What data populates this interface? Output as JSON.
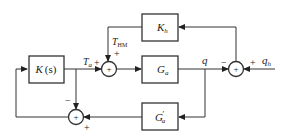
{
  "diagram": {
    "type": "block-diagram",
    "blocks": [
      {
        "id": "K",
        "main": "K",
        "arg": "(s)",
        "sub": ""
      },
      {
        "id": "Ga",
        "main": "G",
        "sub": "a"
      },
      {
        "id": "Kh",
        "main": "K",
        "sub": "h"
      },
      {
        "id": "Gpa",
        "main": "G",
        "prime": "′",
        "sub": "a"
      }
    ],
    "signals": {
      "Ta": {
        "main": "T",
        "sub": "a"
      },
      "THM": {
        "main": "T",
        "sub": "HM"
      },
      "q": {
        "main": "q"
      },
      "qh": {
        "main": "q",
        "sub": "h"
      }
    },
    "summing_junctions": [
      {
        "id": "sum_top",
        "symbol": "+",
        "signs": {
          "left": "+",
          "top": "+"
        }
      },
      {
        "id": "sum_right",
        "symbol": "+",
        "signs": {
          "left": "−",
          "right": "+"
        }
      },
      {
        "id": "sum_bottom",
        "symbol": "+",
        "signs": {
          "top": "−",
          "bottom": "+"
        }
      }
    ]
  }
}
